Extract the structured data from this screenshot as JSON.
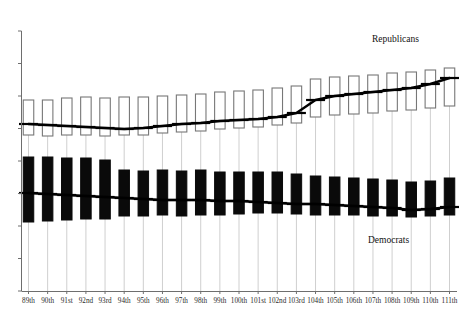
{
  "chart_data": {
    "type": "bar",
    "variant": "candlestick-range-with-trendline",
    "title": "",
    "subtitle": "",
    "xlabel": "",
    "ylabel": "",
    "grid": false,
    "legend_position": "inline-annotations",
    "axis": {
      "y_tick_count": 9,
      "y_axis_visible": true,
      "y_tick_labels_visible": false,
      "x_axis_visible": true
    },
    "categories": [
      "89th",
      "90th",
      "91st",
      "92nd",
      "93rd",
      "94th",
      "95th",
      "96th",
      "97th",
      "98th",
      "99th",
      "100th",
      "101st",
      "102nd",
      "103rd",
      "104th",
      "105th",
      "106th",
      "107th",
      "108th",
      "109th",
      "110th",
      "111th"
    ],
    "series": [
      {
        "name": "Republicans",
        "color": "#ffffff",
        "edge_color": "#777777",
        "box_top": [
          100,
          100,
          98,
          97,
          98,
          97,
          97,
          96,
          95,
          94,
          92,
          91,
          90,
          88,
          86,
          79,
          77,
          76,
          75,
          73,
          72,
          70,
          68
        ],
        "box_bottom": [
          135,
          136,
          135,
          135,
          136,
          135,
          135,
          133,
          132,
          131,
          129,
          128,
          127,
          125,
          123,
          117,
          115,
          114,
          113,
          111,
          110,
          108,
          106
        ],
        "median": [
          124,
          125,
          126,
          127,
          128,
          129,
          128,
          126,
          124,
          123,
          121,
          120,
          119,
          117,
          113,
          100,
          96,
          94,
          92,
          90,
          88,
          84,
          78
        ]
      },
      {
        "name": "Democrats",
        "color": "#0a0a0a",
        "edge_color": "#0a0a0a",
        "box_top": [
          157,
          157,
          158,
          158,
          160,
          170,
          171,
          170,
          171,
          170,
          172,
          172,
          172,
          172,
          174,
          176,
          177,
          178,
          179,
          180,
          182,
          181,
          178
        ],
        "box_bottom": [
          222,
          221,
          220,
          219,
          219,
          216,
          216,
          215,
          216,
          215,
          215,
          214,
          213,
          213,
          214,
          215,
          215,
          215,
          216,
          216,
          217,
          216,
          215
        ],
        "median": [
          193,
          194,
          195,
          196,
          197,
          198,
          199,
          200,
          200,
          200,
          201,
          201,
          202,
          203,
          204,
          204,
          205,
          206,
          207,
          208,
          210,
          209,
          207
        ]
      }
    ],
    "annotations": [
      {
        "name": "Republicans",
        "x": 372,
        "y": 42
      },
      {
        "name": "Democrats",
        "x": 368,
        "y": 243
      }
    ]
  },
  "labels": {
    "republicans": "Republicans",
    "democrats": "Democrats"
  },
  "colors": {
    "republican_fill": "#ffffff",
    "republican_edge": "#777777",
    "democrat_fill": "#0a0a0a",
    "trend_line": "#000000",
    "stem": "#cfcfcf",
    "axis": "#6e6e6e",
    "tick_label": "#2b2b2b"
  }
}
